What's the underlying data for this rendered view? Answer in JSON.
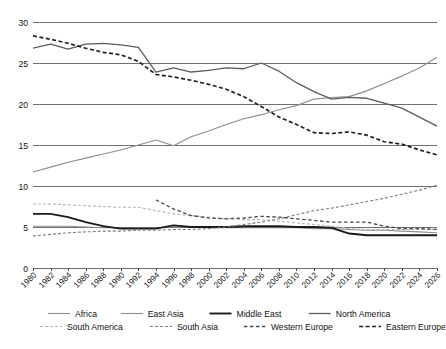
{
  "chart_data": {
    "type": "line",
    "title": "",
    "xlabel": "",
    "ylabel": "",
    "xlim": [
      1980,
      2026
    ],
    "ylim": [
      0,
      30
    ],
    "yticks": [
      0,
      5,
      10,
      15,
      20,
      25,
      30
    ],
    "grid": true,
    "legend_position": "bottom",
    "x": [
      1980,
      1982,
      1984,
      1986,
      1988,
      1990,
      1992,
      1994,
      1996,
      1998,
      2000,
      2002,
      2004,
      2006,
      2008,
      2010,
      2012,
      2014,
      2016,
      2018,
      2020,
      2022,
      2024,
      2026
    ],
    "xtick_labels": [
      "1980",
      "1982",
      "1984",
      "1986",
      "1988",
      "1990",
      "1992",
      "1994",
      "1996",
      "1998",
      "2000",
      "2002",
      "2004",
      "2006",
      "2008",
      "2010",
      "2012",
      "2014",
      "2016",
      "2018",
      "2020",
      "2022",
      "2024",
      "2026"
    ],
    "series": [
      {
        "name": "Africa",
        "color": "#8d8d8d",
        "width": 1.1,
        "dash": "none",
        "values": [
          11.7,
          12.3,
          12.9,
          13.4,
          13.9,
          14.4,
          15.0,
          15.6,
          14.9,
          16.0,
          16.7,
          17.5,
          18.2,
          18.7,
          19.3,
          19.8,
          20.6,
          20.8,
          20.9,
          21.6,
          22.5,
          23.4,
          24.4,
          25.7
        ]
      },
      {
        "name": "East Asia",
        "color": "#8d8d8d",
        "width": 1.1,
        "dash": "none",
        "values": [
          5.1,
          5.1,
          5.1,
          5.0,
          4.9,
          4.9,
          4.9,
          4.9,
          5.0,
          5.0,
          4.9,
          4.9,
          4.9,
          4.9,
          4.9,
          4.9,
          4.8,
          4.8,
          4.7,
          4.6,
          4.6,
          4.5,
          4.4,
          4.3
        ]
      },
      {
        "name": "Middle East",
        "color": "#1b1b1b",
        "width": 1.9,
        "dash": "none",
        "values": [
          6.6,
          6.6,
          6.2,
          5.6,
          5.1,
          4.8,
          4.8,
          4.8,
          5.2,
          5.0,
          5.0,
          5.0,
          5.1,
          5.1,
          5.1,
          5.0,
          5.0,
          4.9,
          4.2,
          4.0,
          4.0,
          4.0,
          4.0,
          4.0
        ]
      },
      {
        "name": "North America",
        "color": "#5d5d5d",
        "width": 1.3,
        "dash": "none",
        "values": [
          26.8,
          27.3,
          26.7,
          27.3,
          27.4,
          27.2,
          26.9,
          23.9,
          24.4,
          23.9,
          24.1,
          24.4,
          24.3,
          25.0,
          24.0,
          22.6,
          21.5,
          20.6,
          20.8,
          20.7,
          20.1,
          19.5,
          18.4,
          17.3
        ]
      },
      {
        "name": "South America",
        "color": "#b3b3b3",
        "width": 1.1,
        "dash": "3,2",
        "values": [
          7.8,
          7.8,
          7.7,
          7.6,
          7.5,
          7.4,
          7.4,
          7.0,
          6.6,
          6.4,
          6.2,
          6.0,
          5.9,
          5.9,
          5.7,
          5.5,
          5.3,
          5.1,
          4.8,
          4.7,
          4.7,
          4.7,
          4.7,
          4.7
        ]
      },
      {
        "name": "South Asia",
        "color": "#7d7d7d",
        "width": 1.1,
        "dash": "3,2",
        "values": [
          3.9,
          4.1,
          4.3,
          4.4,
          4.5,
          4.5,
          4.6,
          4.6,
          4.7,
          4.7,
          4.8,
          5.0,
          5.3,
          5.6,
          6.0,
          6.5,
          7.0,
          7.3,
          7.7,
          8.1,
          8.5,
          9.0,
          9.5,
          10.1
        ]
      },
      {
        "name": "Western Europe",
        "color": "#4a4a4a",
        "width": 1.3,
        "dash": "3.5,2.5",
        "values": [
          null,
          null,
          null,
          null,
          null,
          null,
          null,
          8.3,
          7.2,
          6.4,
          6.1,
          6.0,
          6.1,
          6.3,
          6.2,
          6.0,
          5.8,
          5.6,
          5.6,
          5.6,
          5.1,
          4.8,
          4.8,
          4.7
        ]
      },
      {
        "name": "Eastern Europe",
        "color": "#222222",
        "width": 1.7,
        "dash": "4,2.5",
        "values": [
          28.3,
          27.9,
          27.4,
          26.8,
          26.3,
          26.0,
          25.2,
          23.6,
          23.3,
          22.9,
          22.4,
          21.8,
          20.9,
          19.7,
          18.4,
          17.5,
          16.5,
          16.4,
          16.6,
          16.2,
          15.4,
          15.1,
          14.4,
          13.8
        ]
      }
    ],
    "legend_rows": [
      [
        "Africa",
        "East Asia",
        "Middle East",
        "North America"
      ],
      [
        "South America",
        "South Asia",
        "Western Europe",
        "Eastern Europe"
      ]
    ]
  },
  "layout": {
    "plot_left": 33,
    "plot_right": 437,
    "plot_top": 22,
    "plot_bottom": 268
  }
}
